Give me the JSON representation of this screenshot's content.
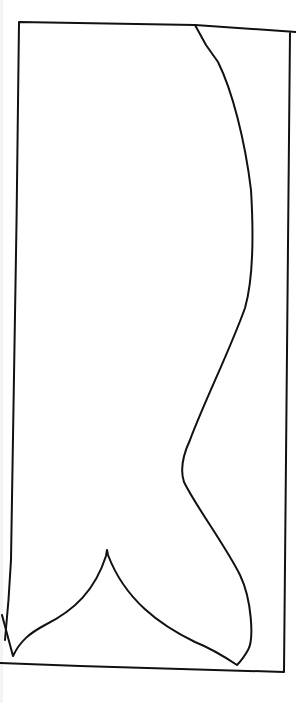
{
  "diagram": {
    "type": "line-drawing",
    "background_color": "#ffffff",
    "stroke_color": "#111111",
    "stroke_width": 2,
    "frame_path": "M19,22 L195,25 L296,32 M290,32 C289,200 288,400 284,672 M284,672 L80,666 L0,663 M19,22 C17,200 14,420 11,560 C9,600 6,630 5,640",
    "tail_path": "M195,25 L206,45 L218,62 C232,90 245,140 251,190 C254,240 253,280 245,308 C230,350 205,400 190,440 C183,455 180,470 184,482 C195,505 225,545 240,575 C252,600 254,640 248,650 C244,657 240,662 237,665 C225,657 210,648 195,642 C160,625 125,600 108,555 L107,550 L106,556 C95,590 75,610 45,625 C30,633 20,641 13,656 C10,645 6,630 2,615"
  }
}
